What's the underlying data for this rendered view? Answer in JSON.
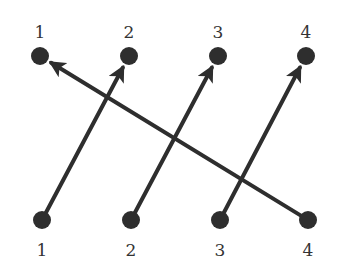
{
  "diagram": {
    "type": "bipartite-mapping",
    "colors": {
      "ink": "#2e2e2e",
      "label": "#333333",
      "background": "#ffffff"
    },
    "top_nodes": [
      {
        "id": "t1",
        "label": "1",
        "x": 40,
        "y": 56
      },
      {
        "id": "t2",
        "label": "2",
        "x": 129,
        "y": 56
      },
      {
        "id": "t3",
        "label": "3",
        "x": 218,
        "y": 56
      },
      {
        "id": "t4",
        "label": "4",
        "x": 306,
        "y": 56
      }
    ],
    "bottom_nodes": [
      {
        "id": "b1",
        "label": "1",
        "x": 42,
        "y": 220
      },
      {
        "id": "b2",
        "label": "2",
        "x": 131,
        "y": 220
      },
      {
        "id": "b3",
        "label": "3",
        "x": 220,
        "y": 220
      },
      {
        "id": "b4",
        "label": "4",
        "x": 308,
        "y": 220
      }
    ],
    "arrows": [
      {
        "from": "b1",
        "to": "t2"
      },
      {
        "from": "b2",
        "to": "t3"
      },
      {
        "from": "b3",
        "to": "t4"
      },
      {
        "from": "b4",
        "to": "t1"
      }
    ]
  }
}
